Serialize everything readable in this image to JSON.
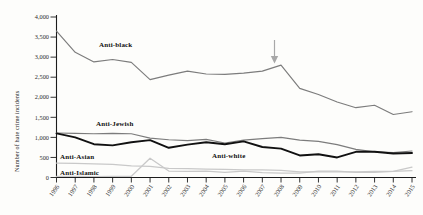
{
  "chart_data": {
    "type": "line",
    "title": "",
    "xlabel": "",
    "ylabel": "Number of hate crime incidents",
    "ylim": [
      0,
      4000
    ],
    "ytick_labels": [
      "4,000",
      "3,500",
      "3,000",
      "2,500",
      "2,000",
      "1,500",
      "1,000",
      "500",
      "0"
    ],
    "ytick_values": [
      4000,
      3500,
      3000,
      2500,
      2000,
      1500,
      1000,
      500,
      0
    ],
    "grid": false,
    "legend": "inline-labels",
    "categories": [
      "1996",
      "1997",
      "1998",
      "1999",
      "2000",
      "2001",
      "2002",
      "2003",
      "2004",
      "2005",
      "2006",
      "2007",
      "2008",
      "2009",
      "2010",
      "2011",
      "2012",
      "2013",
      "2014",
      "2015"
    ],
    "series": [
      {
        "name": "Anti-black",
        "color": "#7c7c7c",
        "label": "Anti-black",
        "values": [
          3650,
          3120,
          2880,
          2940,
          2870,
          2440,
          2550,
          2650,
          2580,
          2570,
          2600,
          2650,
          2800,
          2220,
          2070,
          1880,
          1740,
          1800,
          1570,
          1640
        ]
      },
      {
        "name": "Anti-Jewish",
        "color": "#7c7c7c",
        "label": "Anti-Jewish",
        "values": [
          1110,
          1100,
          1090,
          1100,
          1090,
          980,
          940,
          920,
          950,
          860,
          930,
          970,
          1000,
          930,
          900,
          820,
          700,
          640,
          620,
          660
        ]
      },
      {
        "name": "Anti-white",
        "color": "#111111",
        "label": "Anti-white",
        "values": [
          1100,
          1000,
          830,
          800,
          880,
          930,
          740,
          820,
          880,
          830,
          900,
          760,
          720,
          550,
          580,
          500,
          640,
          640,
          600,
          610
        ]
      },
      {
        "name": "Anti-Asian",
        "color": "#c9c9c9",
        "label": "Anti-Asian",
        "values": [
          360,
          350,
          340,
          330,
          290,
          280,
          230,
          220,
          210,
          200,
          190,
          190,
          180,
          140,
          140,
          140,
          140,
          150,
          150,
          170
        ]
      },
      {
        "name": "Anti-Islamic",
        "color": "#c9c9c9",
        "label": "Anti-Islamic",
        "values": [
          30,
          30,
          25,
          30,
          30,
          480,
          160,
          150,
          160,
          130,
          160,
          120,
          110,
          110,
          160,
          160,
          130,
          130,
          150,
          260
        ]
      }
    ],
    "annotations": [
      {
        "name": "arrow-2008",
        "type": "down-arrow",
        "x": "2008",
        "y": 2800,
        "text": ""
      }
    ]
  }
}
